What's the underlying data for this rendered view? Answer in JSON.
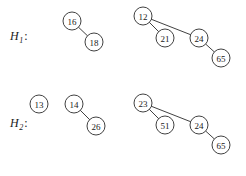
{
  "figure": {
    "width": 246,
    "height": 176,
    "background_color": "#ffffff",
    "stroke_color": "#2b2b2b",
    "text_color": "#1a1a1a",
    "node_radius": 9
  },
  "heaps": [
    {
      "id": "H1",
      "label_letter": "H",
      "label_subscript": "1",
      "label_colon": ":",
      "label_x": 10,
      "label_y": 30,
      "nodes": [
        {
          "key": "16",
          "x": 72,
          "y": 21
        },
        {
          "key": "18",
          "x": 94,
          "y": 42
        },
        {
          "key": "12",
          "x": 143,
          "y": 16
        },
        {
          "key": "21",
          "x": 165,
          "y": 38
        },
        {
          "key": "24",
          "x": 199,
          "y": 38
        },
        {
          "key": "65",
          "x": 221,
          "y": 58
        }
      ],
      "edges": [
        {
          "from": "16",
          "to": "18"
        },
        {
          "from": "12",
          "to": "21"
        },
        {
          "from": "12",
          "to": "24"
        },
        {
          "from": "24",
          "to": "65"
        }
      ]
    },
    {
      "id": "H2",
      "label_letter": "H",
      "label_subscript": "2",
      "label_colon": ":",
      "label_x": 10,
      "label_y": 117,
      "nodes": [
        {
          "key": "13",
          "x": 39,
          "y": 104
        },
        {
          "key": "14",
          "x": 74,
          "y": 104
        },
        {
          "key": "26",
          "x": 96,
          "y": 126
        },
        {
          "key": "23",
          "x": 143,
          "y": 103
        },
        {
          "key": "51",
          "x": 165,
          "y": 125
        },
        {
          "key": "24",
          "x": 199,
          "y": 125
        },
        {
          "key": "65",
          "x": 221,
          "y": 145
        }
      ],
      "edges": [
        {
          "from": "14",
          "to": "26"
        },
        {
          "from": "23",
          "to": "51"
        },
        {
          "from": "23",
          "to": "24"
        },
        {
          "from": "24",
          "to": "65"
        }
      ]
    }
  ],
  "chart_data": {
    "type": "diagram",
    "subtype": "binomial-heap-forest",
    "title": "",
    "structures": [
      {
        "name": "H1",
        "trees": [
          {
            "root": "16",
            "nodes": [
              "16",
              "18"
            ],
            "links": [
              [
                "16",
                "18"
              ]
            ]
          },
          {
            "root": "12",
            "nodes": [
              "12",
              "21",
              "24",
              "65"
            ],
            "links": [
              [
                "12",
                "21"
              ],
              [
                "12",
                "24"
              ],
              [
                "24",
                "65"
              ]
            ]
          }
        ]
      },
      {
        "name": "H2",
        "trees": [
          {
            "root": "13",
            "nodes": [
              "13"
            ],
            "links": []
          },
          {
            "root": "14",
            "nodes": [
              "14",
              "26"
            ],
            "links": [
              [
                "14",
                "26"
              ]
            ]
          },
          {
            "root": "23",
            "nodes": [
              "23",
              "51",
              "24",
              "65"
            ],
            "links": [
              [
                "23",
                "51"
              ],
              [
                "23",
                "24"
              ],
              [
                "24",
                "65"
              ]
            ]
          }
        ]
      }
    ]
  }
}
